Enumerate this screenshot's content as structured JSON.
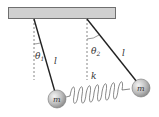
{
  "diagram": {
    "labels": {
      "theta1": "θ",
      "theta1_sub": "1",
      "theta2": "θ",
      "theta2_sub": "2",
      "length_left": "l",
      "length_right": "l",
      "spring": "k",
      "mass_left": "m",
      "mass_right": "m"
    },
    "colors": {
      "support": "#cfcfcf",
      "support_border": "#6f6f6f",
      "rod": "#222222",
      "mass": "#bdbdbd",
      "spring": "#555555"
    }
  }
}
